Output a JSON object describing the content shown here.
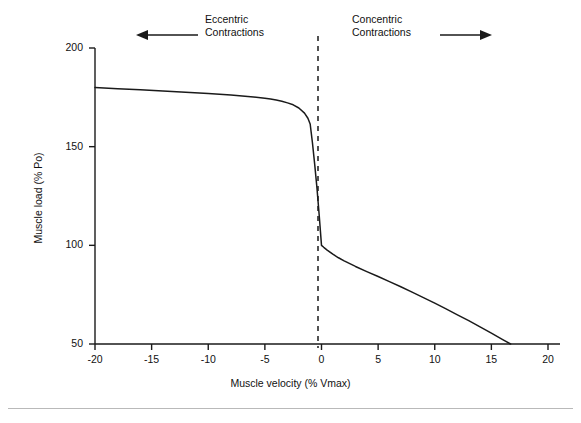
{
  "figure": {
    "background_color": "#ffffff",
    "line_color": "#1a1a1a",
    "text_color": "#111111",
    "rule_color": "#b9b9b9"
  },
  "annotations": {
    "eccentric": {
      "label": "Eccentric\nContractions",
      "arrow": "left-arrow-icon",
      "direction": "left"
    },
    "concentric": {
      "label": "Concentric\nContractions",
      "arrow": "right-arrow-icon",
      "direction": "right"
    },
    "zero_line": {
      "name": "zero-velocity-dashed-line",
      "value": 0,
      "style": "dashed"
    }
  },
  "chart_data": {
    "type": "line",
    "title": "",
    "xlabel": "Muscle velocity (% Vmax)",
    "ylabel": "Muscle load (% Po)",
    "xlim": [
      -20,
      20
    ],
    "ylim": [
      50,
      200
    ],
    "xticks": [
      -20,
      -15,
      -10,
      -5,
      0,
      5,
      10,
      15,
      20
    ],
    "xticklabels": [
      "-20",
      "-15",
      "-10",
      "-5",
      "0",
      "5",
      "10",
      "15",
      "20"
    ],
    "yticks": [
      50,
      100,
      150,
      200
    ],
    "yticklabels": [
      "50",
      "100",
      "150",
      "200"
    ],
    "grid": false,
    "legend": false,
    "series": [
      {
        "name": "Force-velocity relationship",
        "x": [
          -20,
          -18,
          -16,
          -14,
          -12,
          -10,
          -8,
          -6,
          -5,
          -4.5,
          -4,
          -3.5,
          -3,
          -2.5,
          -2,
          -1.5,
          -1.2,
          -1.0,
          -0.8,
          -0.6,
          -0.4,
          -0.2,
          0,
          0.2,
          0.5,
          1,
          1.5,
          2,
          3,
          4,
          5,
          6,
          7,
          8,
          9,
          10,
          11,
          12,
          13,
          14,
          15,
          16,
          16.7
        ],
        "y": [
          180,
          179.4,
          178.8,
          178.2,
          177.6,
          177,
          176.2,
          175.2,
          174.5,
          174.1,
          173.6,
          173.0,
          172.2,
          171.2,
          169.6,
          167.0,
          164.4,
          161.5,
          152,
          141,
          129,
          115,
          100,
          99.0,
          97.6,
          95.5,
          93.7,
          92.1,
          89.3,
          86.7,
          84.2,
          81.6,
          79.0,
          76.3,
          73.5,
          70.7,
          67.8,
          64.8,
          61.8,
          58.7,
          55.5,
          52.2,
          50
        ]
      }
    ],
    "annotations": [
      {
        "text": "Eccentric Contractions",
        "region": "x < 0"
      },
      {
        "text": "Concentric Contractions",
        "region": "x > 0"
      }
    ]
  }
}
